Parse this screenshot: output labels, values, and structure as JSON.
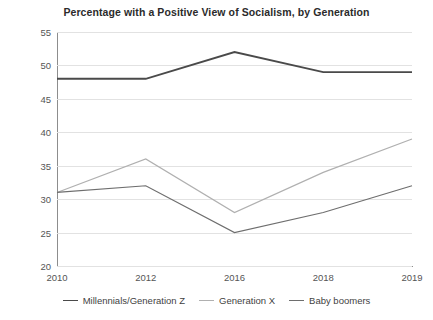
{
  "chart_data": {
    "type": "line",
    "title": "Percentage with a Positive View of Socialism, by Generation",
    "xlabel": "",
    "ylabel": "",
    "categories": [
      "2010",
      "2012",
      "2016",
      "2018",
      "2019"
    ],
    "ylim": [
      20,
      55
    ],
    "yticks": [
      20,
      25,
      30,
      35,
      40,
      45,
      50,
      55
    ],
    "grid": "horizontal",
    "legend_position": "bottom",
    "series": [
      {
        "name": "Millennials/Generation Z",
        "values": [
          48,
          48,
          52,
          49,
          49
        ],
        "color": "#4a4a4a",
        "width": 1.9
      },
      {
        "name": "Generation X",
        "values": [
          31,
          36,
          28,
          34,
          39
        ],
        "color": "#b0b0b0",
        "width": 1.2
      },
      {
        "name": "Baby boomers",
        "values": [
          31,
          32,
          25,
          28,
          32
        ],
        "color": "#6e6e6e",
        "width": 1.2
      }
    ]
  },
  "axis": {
    "y_tick_labels": [
      "55",
      "50",
      "45",
      "40",
      "35",
      "30",
      "25",
      "20"
    ],
    "x_tick_labels": [
      "2010",
      "2012",
      "2016",
      "2018",
      "2019"
    ]
  },
  "legend": {
    "items": [
      {
        "label": "Millennials/Generation Z",
        "color": "#4a4a4a"
      },
      {
        "label": "Generation X",
        "color": "#b0b0b0"
      },
      {
        "label": "Baby boomers",
        "color": "#6e6e6e"
      }
    ]
  },
  "colors": {
    "background": "#ffffff",
    "gridline": "#e2e2e2",
    "axis": "#8d8d8d",
    "title_text": "#2b2b2b",
    "tick_text": "#555555"
  }
}
